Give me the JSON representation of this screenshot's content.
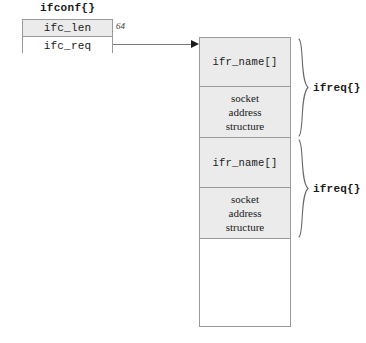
{
  "ifconf": {
    "title": "ifconf{}",
    "rows": [
      {
        "label": "ifc_len",
        "shaded": true
      },
      {
        "label": "ifc_req",
        "shaded": false
      }
    ],
    "len_value": "64"
  },
  "buffer": {
    "groups": [
      {
        "brace_label": "ifreq{}",
        "cells": [
          {
            "kind": "name",
            "label": "ifr_name[]"
          },
          {
            "kind": "sockaddr",
            "lines": [
              "socket",
              "address",
              "structure"
            ]
          }
        ]
      },
      {
        "brace_label": "ifreq{}",
        "cells": [
          {
            "kind": "name",
            "label": "ifr_name[]"
          },
          {
            "kind": "sockaddr",
            "lines": [
              "socket",
              "address",
              "structure"
            ]
          }
        ]
      }
    ],
    "empty_region": ""
  },
  "colors": {
    "cell_shading": "#ebebeb",
    "border": "#9a9a9a",
    "text": "#1a1a1a",
    "connector": "#7a7a7a",
    "brace": "#6a6a6a"
  }
}
